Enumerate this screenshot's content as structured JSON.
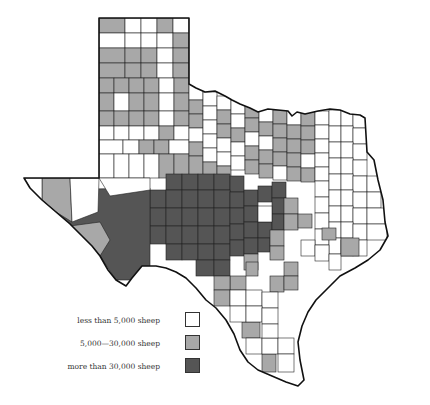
{
  "map": {
    "subject": "Texas sheep population by county",
    "colors": {
      "low": "#ffffff",
      "medium": "#a8a8a8",
      "high": "#555555",
      "border": "#222222"
    }
  },
  "legend": {
    "items": [
      {
        "label": "less than 5,000 sheep",
        "color": "#ffffff"
      },
      {
        "label": "5,000—30,000 sheep",
        "color": "#a8a8a8"
      },
      {
        "label": "more than 30,000 sheep",
        "color": "#555555"
      }
    ]
  }
}
